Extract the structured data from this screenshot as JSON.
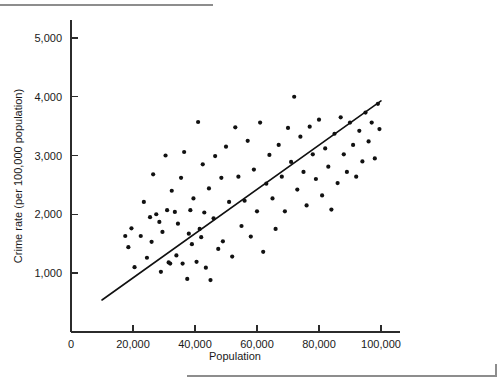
{
  "figure": {
    "top_rule": "",
    "bottom_rule": ""
  },
  "chart_data": {
    "type": "scatter",
    "title": "",
    "xlabel": "Population",
    "ylabel": "Crime rate (per 100,000 population)",
    "xlim": [
      0,
      105000
    ],
    "ylim": [
      0,
      5400
    ],
    "grid": false,
    "legend": null,
    "xticks": [
      0,
      20000,
      40000,
      60000,
      80000,
      100000
    ],
    "xtick_labels": [
      "0",
      "20,000",
      "40,000",
      "60,000",
      "80,000",
      "100,000"
    ],
    "yticks": [
      1000,
      2000,
      3000,
      4000,
      5000
    ],
    "ytick_labels": [
      "1,000",
      "2,000",
      "3,000",
      "4,000",
      "5,000"
    ],
    "trendline": {
      "type": "linear-fit",
      "x_start": 10000,
      "y_start": 540,
      "x_end": 100000,
      "y_end": 3930
    },
    "points": [
      [
        17500,
        1630
      ],
      [
        18500,
        1440
      ],
      [
        19500,
        1760
      ],
      [
        20500,
        1100
      ],
      [
        22500,
        1630
      ],
      [
        23500,
        2210
      ],
      [
        24500,
        1260
      ],
      [
        25500,
        1950
      ],
      [
        26000,
        1530
      ],
      [
        26500,
        2680
      ],
      [
        27500,
        2000
      ],
      [
        28500,
        1870
      ],
      [
        29000,
        1020
      ],
      [
        29500,
        1700
      ],
      [
        30500,
        3000
      ],
      [
        31000,
        2070
      ],
      [
        31500,
        1180
      ],
      [
        32000,
        1160
      ],
      [
        32500,
        2400
      ],
      [
        33500,
        2040
      ],
      [
        34000,
        1300
      ],
      [
        34500,
        1840
      ],
      [
        35500,
        2620
      ],
      [
        36000,
        1160
      ],
      [
        36500,
        3060
      ],
      [
        37500,
        900
      ],
      [
        38000,
        1670
      ],
      [
        38500,
        2070
      ],
      [
        39000,
        1490
      ],
      [
        39500,
        2270
      ],
      [
        40500,
        1190
      ],
      [
        41000,
        3570
      ],
      [
        41500,
        1750
      ],
      [
        42000,
        1610
      ],
      [
        42500,
        2850
      ],
      [
        43000,
        2030
      ],
      [
        43500,
        1090
      ],
      [
        44500,
        2440
      ],
      [
        45000,
        880
      ],
      [
        46000,
        1930
      ],
      [
        46500,
        2990
      ],
      [
        47500,
        1410
      ],
      [
        48500,
        2620
      ],
      [
        49000,
        1540
      ],
      [
        50000,
        3150
      ],
      [
        51000,
        2210
      ],
      [
        52000,
        1280
      ],
      [
        53000,
        3480
      ],
      [
        54000,
        2640
      ],
      [
        55000,
        1800
      ],
      [
        56000,
        2230
      ],
      [
        57000,
        3250
      ],
      [
        58000,
        1620
      ],
      [
        59000,
        2760
      ],
      [
        60000,
        2050
      ],
      [
        61000,
        3560
      ],
      [
        62000,
        1360
      ],
      [
        63000,
        2520
      ],
      [
        64000,
        3010
      ],
      [
        65000,
        2270
      ],
      [
        66000,
        1750
      ],
      [
        67000,
        3180
      ],
      [
        68000,
        2640
      ],
      [
        69000,
        2050
      ],
      [
        70000,
        3470
      ],
      [
        71000,
        2890
      ],
      [
        72000,
        4000
      ],
      [
        73000,
        2420
      ],
      [
        74000,
        3320
      ],
      [
        75000,
        2720
      ],
      [
        76000,
        2150
      ],
      [
        77000,
        3490
      ],
      [
        78000,
        3020
      ],
      [
        79000,
        2600
      ],
      [
        80000,
        3610
      ],
      [
        81000,
        2320
      ],
      [
        82000,
        3120
      ],
      [
        83000,
        2810
      ],
      [
        84000,
        2080
      ],
      [
        85000,
        3370
      ],
      [
        86000,
        2530
      ],
      [
        87000,
        3650
      ],
      [
        88000,
        3020
      ],
      [
        89000,
        2720
      ],
      [
        90000,
        3560
      ],
      [
        91000,
        3180
      ],
      [
        92000,
        2640
      ],
      [
        93000,
        3420
      ],
      [
        94000,
        2900
      ],
      [
        95000,
        3730
      ],
      [
        96000,
        3240
      ],
      [
        97000,
        3560
      ],
      [
        98000,
        2950
      ],
      [
        99000,
        3880
      ],
      [
        99500,
        3450
      ]
    ]
  }
}
